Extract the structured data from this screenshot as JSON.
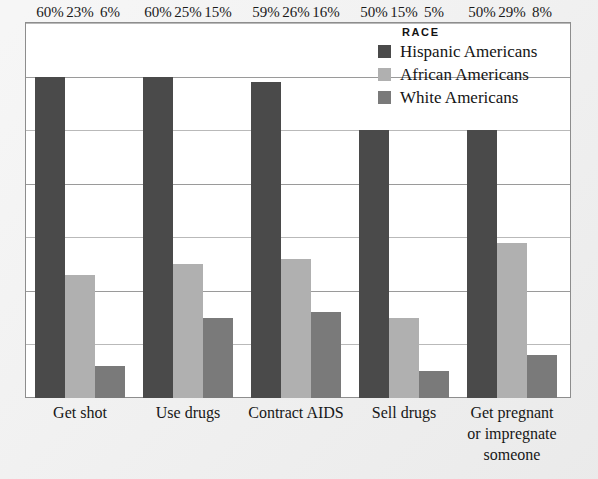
{
  "colors": {
    "background": "#ececec",
    "plot_background": "#ffffff",
    "frame_border": "#8d8d8d",
    "gridline": "#9a9a9a",
    "hispanic": "#4a4a4a",
    "african": "#b0b0b0",
    "white": "#7a7a7a",
    "text": "#141414"
  },
  "legend": {
    "title": "RACE",
    "items": [
      {
        "label": "Hispanic Americans",
        "color": "#4a4a4a",
        "swatch": "legend-swatch-hispanic"
      },
      {
        "label": "African Americans",
        "color": "#b0b0b0",
        "swatch": "legend-swatch-african"
      },
      {
        "label": "White Americans",
        "color": "#7a7a7a",
        "swatch": "legend-swatch-white"
      }
    ]
  },
  "chart_data": {
    "type": "bar",
    "title": "",
    "xlabel": "",
    "ylabel": "",
    "ylim": [
      0,
      70
    ],
    "grid": true,
    "grid_values": [
      10,
      20,
      30,
      40,
      50,
      60,
      70
    ],
    "legend_position": "top-right",
    "categories": [
      "Get shot",
      "Use drugs",
      "Contract AIDS",
      "Sell drugs",
      "Get pregnant or impregnate someone"
    ],
    "category_lines": [
      [
        "Get shot"
      ],
      [
        "Use drugs"
      ],
      [
        "Contract AIDS"
      ],
      [
        "Sell drugs"
      ],
      [
        "Get pregnant",
        "or impregnate",
        "someone"
      ]
    ],
    "series": [
      {
        "name": "Hispanic Americans",
        "color": "#4a4a4a",
        "values": [
          60,
          60,
          59,
          50,
          50
        ],
        "labels": [
          "60%",
          "60%",
          "59%",
          "50%",
          "50%"
        ]
      },
      {
        "name": "African Americans",
        "color": "#b0b0b0",
        "values": [
          23,
          25,
          26,
          15,
          29
        ],
        "labels": [
          "23%",
          "25%",
          "26%",
          "15%",
          "29%"
        ]
      },
      {
        "name": "White Americans",
        "color": "#7a7a7a",
        "values": [
          6,
          15,
          16,
          5,
          8
        ],
        "labels": [
          "6%",
          "15%",
          "16%",
          "5%",
          "8%"
        ]
      }
    ]
  }
}
